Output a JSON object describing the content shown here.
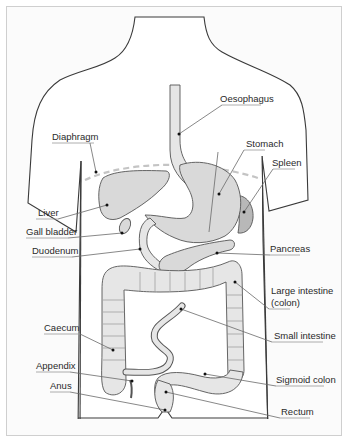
{
  "diagram": {
    "labels_left": [
      {
        "id": "diaphragm",
        "text": "Diaphragm"
      },
      {
        "id": "liver",
        "text": "Liver"
      },
      {
        "id": "gall_bladder",
        "text": "Gall bladder"
      },
      {
        "id": "duodenum",
        "text": "Duodenum"
      },
      {
        "id": "caecum",
        "text": "Caecum"
      },
      {
        "id": "appendix",
        "text": "Appendix"
      },
      {
        "id": "anus",
        "text": "Anus"
      }
    ],
    "labels_right": [
      {
        "id": "oesophagus",
        "text": "Oesophagus"
      },
      {
        "id": "stomach",
        "text": "Stomach"
      },
      {
        "id": "spleen",
        "text": "Spleen"
      },
      {
        "id": "pancreas",
        "text": "Pancreas"
      },
      {
        "id": "large_intestine_1",
        "text": "Large intestine"
      },
      {
        "id": "large_intestine_2",
        "text": "(colon)"
      },
      {
        "id": "small_intestine",
        "text": "Small intestine"
      },
      {
        "id": "sigmoid_colon",
        "text": "Sigmoid colon"
      },
      {
        "id": "rectum",
        "text": "Rectum"
      }
    ],
    "colors": {
      "organ_fill": "#d9d9d9",
      "spleen_fill": "#b8b8b8",
      "outline": "#3a3a3a",
      "diaphragm_dash": "#c4c4c4",
      "frame": "#cfcfcf"
    }
  }
}
